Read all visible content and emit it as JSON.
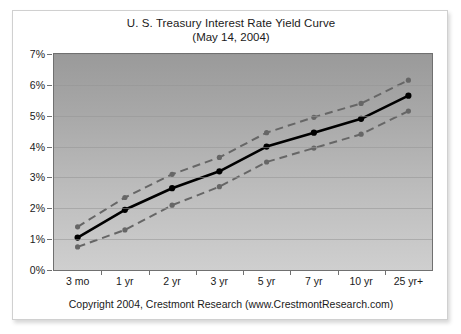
{
  "chart_data": {
    "type": "line",
    "title": "U. S. Treasury Interest Rate Yield Curve",
    "subtitle": "(May 14, 2004)",
    "footer": "Copyright 2004, Crestmont Research (www.CrestmontResearch.com)",
    "xlabel": "",
    "ylabel": "",
    "categories": [
      "3 mo",
      "1 yr",
      "2 yr",
      "3 yr",
      "5 yr",
      "7 yr",
      "10 yr",
      "25 yr+"
    ],
    "ylim": [
      0,
      7
    ],
    "ytick_labels": [
      "0%",
      "1%",
      "2%",
      "3%",
      "4%",
      "5%",
      "6%",
      "7%"
    ],
    "ytick_values": [
      0,
      1,
      2,
      3,
      4,
      5,
      6,
      7
    ],
    "grid": true,
    "legend": "none",
    "series": [
      {
        "name": "Upper Band",
        "style": "dashed",
        "color": "#666666",
        "values": [
          1.4,
          2.35,
          3.1,
          3.65,
          4.45,
          4.95,
          5.4,
          6.15
        ]
      },
      {
        "name": "Yield Curve",
        "style": "solid",
        "color": "#000000",
        "values": [
          1.05,
          1.95,
          2.65,
          3.2,
          4.0,
          4.45,
          4.9,
          5.65
        ]
      },
      {
        "name": "Lower Band",
        "style": "dashed",
        "color": "#666666",
        "values": [
          0.75,
          1.3,
          2.1,
          2.7,
          3.5,
          3.95,
          4.4,
          5.15
        ]
      }
    ]
  },
  "colors": {
    "plot_top": "#9a9a9a",
    "plot_bottom": "#cfcfcf",
    "curve": "#000000",
    "band": "#666666",
    "border": "#707070",
    "card": "#ffffff"
  }
}
